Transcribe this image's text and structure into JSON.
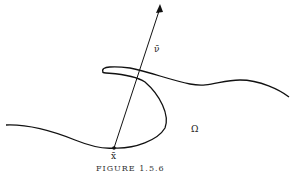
{
  "figure": {
    "labels": {
      "normal_vector": "ν̄",
      "point": "x̄",
      "region": "Ω"
    },
    "caption": "FIGURE 1.5.6"
  }
}
